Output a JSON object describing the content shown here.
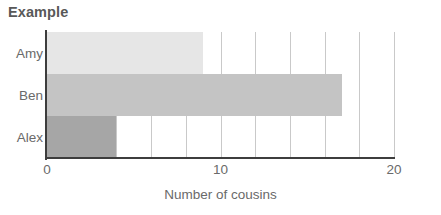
{
  "chart_data": {
    "type": "bar",
    "orientation": "horizontal",
    "title": "Example",
    "xlabel": "Number of cousins",
    "ylabel": "",
    "categories": [
      "Alex",
      "Ben",
      "Amy"
    ],
    "values": [
      4,
      17,
      9
    ],
    "xlim": [
      0,
      20
    ],
    "xticks": [
      0,
      10,
      20
    ],
    "xtick_labels": [
      "0",
      "10",
      "20"
    ],
    "grid": true,
    "grid_axis": "x",
    "grid_interval": 2,
    "legend": false,
    "bars": [
      {
        "category": "Amy",
        "value": 9,
        "label": "Amy",
        "color": "#e6e6e6"
      },
      {
        "category": "Ben",
        "value": 17,
        "label": "Ben",
        "color": "#c4c4c4"
      },
      {
        "category": "Alex",
        "value": 4,
        "label": "Alex",
        "color": "#a6a6a6"
      }
    ]
  },
  "chart": {
    "title": "Example",
    "xlabel": "Number of cousins",
    "xtick_labels": [
      "0",
      "10",
      "20"
    ],
    "ytick_labels": [
      "Amy",
      "Ben",
      "Alex"
    ]
  },
  "colors": {
    "axis": "#3d3d3d",
    "gridline": "#c9c9c9",
    "title_text": "#585858",
    "tick_text": "#6a6a6a",
    "background": "#ffffff"
  }
}
